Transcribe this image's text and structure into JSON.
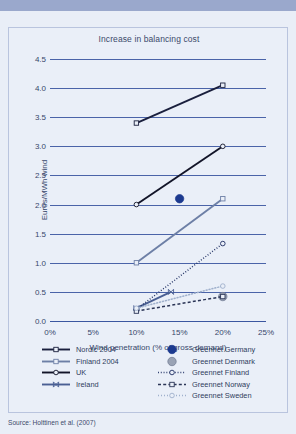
{
  "source_note": "Source: Holttinen et al. (2007)",
  "chart_data": {
    "type": "line",
    "title": "Increase in balancing cost",
    "xlabel": "Wind penetration (% of gross demand)",
    "ylabel": "Euros/MWh wind",
    "xlim": [
      0,
      25
    ],
    "ylim": [
      0.0,
      4.5
    ],
    "xticks": [
      "0%",
      "5%",
      "10%",
      "15%",
      "20%",
      "25%"
    ],
    "xtick_values": [
      0,
      5,
      10,
      15,
      20,
      25
    ],
    "yticks": [
      "0.0",
      "0.5",
      "1.0",
      "1.5",
      "2.0",
      "2.5",
      "3.0",
      "3.5",
      "4.0",
      "4.5"
    ],
    "ytick_values": [
      0.0,
      0.5,
      1.0,
      1.5,
      2.0,
      2.5,
      3.0,
      3.5,
      4.0,
      4.5
    ],
    "grid": true,
    "grid_color": "#4a63a8",
    "legend_position": "below",
    "series": [
      {
        "name": "Nordic 2004",
        "x": [
          10,
          20
        ],
        "values": [
          3.4,
          4.05
        ],
        "color": "#1a1f3d",
        "line_style": "solid",
        "marker": "open-square",
        "legend_column": "left"
      },
      {
        "name": "Finland 2004",
        "x": [
          10,
          20
        ],
        "values": [
          1.0,
          2.1
        ],
        "color": "#6d7fa6",
        "line_style": "solid",
        "marker": "open-square",
        "legend_column": "left"
      },
      {
        "name": "UK",
        "x": [
          10,
          20
        ],
        "values": [
          2.0,
          3.0
        ],
        "color": "#121428",
        "line_style": "solid",
        "marker": "open-circle",
        "legend_column": "left"
      },
      {
        "name": "Ireland",
        "x": [
          10,
          14
        ],
        "values": [
          0.22,
          0.5
        ],
        "color": "#4a5f93",
        "line_style": "solid",
        "marker": "bowtie",
        "legend_column": "left"
      },
      {
        "name": "Greennet Germany",
        "x": [
          15
        ],
        "values": [
          2.1
        ],
        "color": "#1c3a8f",
        "line_style": "none",
        "marker": "filled-circle",
        "legend_column": "right"
      },
      {
        "name": "Greennet Denmark",
        "x": [
          20
        ],
        "values": [
          0.42
        ],
        "color": "#9aa3b5",
        "line_style": "none",
        "marker": "filled-circle",
        "legend_column": "right"
      },
      {
        "name": "Greennet Finland",
        "x": [
          10,
          20
        ],
        "values": [
          0.2,
          1.33
        ],
        "color": "#1f2f63",
        "line_style": "dash-dot",
        "marker": "open-circle",
        "legend_column": "right"
      },
      {
        "name": "Greennet Norway",
        "x": [
          10,
          20
        ],
        "values": [
          0.17,
          0.42
        ],
        "color": "#2b3556",
        "line_style": "dashed",
        "marker": "open-square",
        "legend_column": "right"
      },
      {
        "name": "Greennet Sweden",
        "x": [
          10,
          20
        ],
        "values": [
          0.22,
          0.6
        ],
        "color": "#9fb0cc",
        "line_style": "dotted",
        "marker": "open-circle",
        "legend_column": "right"
      }
    ]
  }
}
